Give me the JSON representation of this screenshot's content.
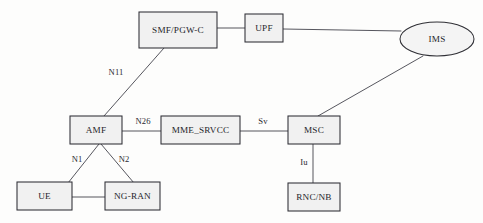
{
  "diagram": {
    "type": "network-node-diagram",
    "background_color": "#fdfdfc",
    "node_fill_color": "#f1f1f1",
    "node_stroke_color": "#2f2f35",
    "edge_stroke_color": "#4d4d55",
    "nodes": [
      {
        "id": "smf_pgwc",
        "label": "SMF/PGW-C",
        "shape": "rect",
        "x": 139,
        "y": 12,
        "w": 78,
        "h": 36
      },
      {
        "id": "upf",
        "label": "UPF",
        "shape": "rect",
        "x": 245,
        "y": 14,
        "w": 38,
        "h": 28
      },
      {
        "id": "ims",
        "label": "IMS",
        "shape": "ellipse",
        "cx": 437,
        "cy": 39,
        "rx": 37,
        "ry": 17
      },
      {
        "id": "amf",
        "label": "AMF",
        "shape": "rect",
        "x": 70,
        "y": 116,
        "w": 52,
        "h": 28
      },
      {
        "id": "mme_srvcc",
        "label": "MME_SRVCC",
        "shape": "rect",
        "x": 161,
        "y": 116,
        "w": 79,
        "h": 28
      },
      {
        "id": "msc",
        "label": "MSC",
        "shape": "rect",
        "x": 288,
        "y": 116,
        "w": 52,
        "h": 28
      },
      {
        "id": "ue",
        "label": "UE",
        "shape": "rect",
        "x": 17,
        "y": 182,
        "w": 55,
        "h": 28
      },
      {
        "id": "ng_ran",
        "label": "NG-RAN",
        "shape": "rect",
        "x": 105,
        "y": 182,
        "w": 55,
        "h": 28
      },
      {
        "id": "rnc_nb",
        "label": "RNC/NB",
        "shape": "rect",
        "x": 288,
        "y": 183,
        "w": 52,
        "h": 28
      }
    ],
    "edges": [
      {
        "id": "e_smf_upf",
        "from": "smf_pgwc",
        "to": "upf",
        "label": "",
        "x1": 217,
        "y1": 28,
        "x2": 245,
        "y2": 28
      },
      {
        "id": "e_upf_ims",
        "from": "upf",
        "to": "ims",
        "label": "",
        "x1": 283,
        "y1": 29,
        "x2": 401,
        "y2": 31
      },
      {
        "id": "e_amf_smf",
        "from": "amf",
        "to": "smf_pgwc",
        "label": "N11",
        "x1": 104,
        "y1": 116,
        "x2": 164,
        "y2": 48,
        "label_x": 116,
        "label_y": 73
      },
      {
        "id": "e_amf_mme",
        "from": "amf",
        "to": "mme_srvcc",
        "label": "N26",
        "x1": 122,
        "y1": 131,
        "x2": 161,
        "y2": 131,
        "label_x": 143,
        "label_y": 122
      },
      {
        "id": "e_mme_msc",
        "from": "mme_srvcc",
        "to": "msc",
        "label": "Sv",
        "x1": 240,
        "y1": 131,
        "x2": 288,
        "y2": 131,
        "label_x": 263,
        "label_y": 122
      },
      {
        "id": "e_msc_ims",
        "from": "msc",
        "to": "ims",
        "label": "",
        "x1": 318,
        "y1": 116,
        "x2": 423,
        "y2": 56
      },
      {
        "id": "e_msc_rnc",
        "from": "msc",
        "to": "rnc_nb",
        "label": "Iu",
        "x1": 313,
        "y1": 144,
        "x2": 313,
        "y2": 183,
        "label_x": 304,
        "label_y": 163
      },
      {
        "id": "e_amf_ue",
        "from": "amf",
        "to": "ue",
        "label": "N1",
        "x1": 99,
        "y1": 144,
        "x2": 68,
        "y2": 183,
        "label_x": 77,
        "label_y": 160
      },
      {
        "id": "e_amf_ngran",
        "from": "amf",
        "to": "ng_ran",
        "label": "N2",
        "x1": 101,
        "y1": 144,
        "x2": 134,
        "y2": 183,
        "label_x": 124,
        "label_y": 160
      },
      {
        "id": "e_ue_ngran",
        "from": "ue",
        "to": "ng_ran",
        "label": "",
        "x1": 72,
        "y1": 197,
        "x2": 105,
        "y2": 197
      }
    ]
  }
}
